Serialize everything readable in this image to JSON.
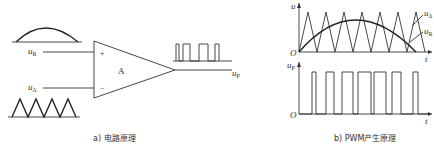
{
  "figure": {
    "panel_a": {
      "caption": "a) 电路原理",
      "amplifier_label": "A",
      "plus_sign": "+",
      "minus_sign": "−",
      "input_plus_label": "u",
      "input_plus_sub": "R",
      "input_minus_label": "u",
      "input_minus_sub": "Δ",
      "output_label": "u",
      "output_sub": "P"
    },
    "panel_b": {
      "caption": "b) PWM产生原理",
      "top_axis_y_label": "u",
      "top_axis_x_label": "t",
      "origin_label": "O",
      "legend_triangle": "u",
      "legend_triangle_sub": "Δ",
      "legend_sine": "u",
      "legend_sine_sub": "R",
      "bottom_axis_y_label": "u",
      "bottom_axis_y_sub": "P",
      "bottom_axis_x_label": "t",
      "bottom_origin_label": "O"
    }
  }
}
